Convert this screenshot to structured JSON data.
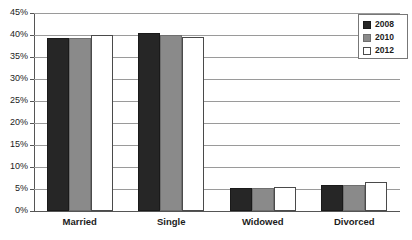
{
  "chart_data": {
    "type": "bar",
    "title": "",
    "subtitle": "",
    "xlabel": "",
    "ylabel": "",
    "categories": [
      "Married",
      "Single",
      "Widowed",
      "Divorced"
    ],
    "series": [
      {
        "name": "2008",
        "color": "#262626",
        "values": [
          39.3,
          40.4,
          5.2,
          5.9
        ]
      },
      {
        "name": "2010",
        "color": "#8a8a8a",
        "values": [
          39.4,
          39.9,
          5.3,
          6.0
        ]
      },
      {
        "name": "2012",
        "color": "#ffffff",
        "values": [
          40.0,
          39.5,
          5.5,
          6.6
        ]
      }
    ],
    "ylim": [
      0,
      45
    ],
    "yticks": [
      0,
      5,
      10,
      15,
      20,
      25,
      30,
      35,
      40,
      45
    ],
    "ytick_labels": [
      "0%",
      "5%",
      "10%",
      "15%",
      "20%",
      "25%",
      "30%",
      "35%",
      "40%",
      "45%"
    ],
    "value_suffix": "%",
    "grid": true,
    "grid_axis": "y",
    "legend_position": "top-right",
    "legend_entries": [
      "2008",
      "2010",
      "2012"
    ]
  }
}
